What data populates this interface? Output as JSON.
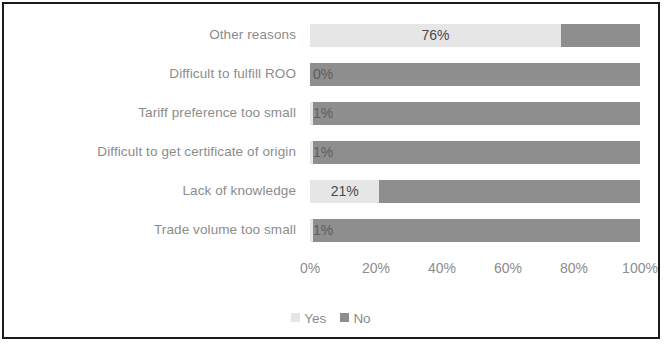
{
  "chart_data": {
    "type": "bar",
    "orientation": "horizontal",
    "stacked": true,
    "stacked_percent": true,
    "title": "",
    "subtitle": "",
    "xlabel": "",
    "ylabel": "",
    "xlim": [
      0,
      100
    ],
    "grid": false,
    "legend_position": "bottom",
    "categories": [
      "Other reasons",
      "Difficult to fulfill ROO",
      "Tariff preference too small",
      "Difficult to get certificate of origin",
      "Lack of knowledge",
      "Trade volume too small"
    ],
    "series": [
      {
        "name": "Yes",
        "color": "#e6e6e6",
        "values": [
          76,
          0,
          1,
          1,
          21,
          1
        ],
        "labels": [
          "76%",
          "0%",
          "1%",
          "1%",
          "21%",
          "1%"
        ]
      },
      {
        "name": "No",
        "color": "#8e8e8e",
        "values": [
          24,
          100,
          99,
          99,
          79,
          99
        ],
        "labels": [
          "",
          "",
          "",
          "",
          "",
          ""
        ]
      }
    ],
    "xticks": [
      0,
      20,
      40,
      60,
      80,
      100
    ],
    "xtick_labels": [
      "0%",
      "20%",
      "40%",
      "60%",
      "80%",
      "100%"
    ]
  },
  "legend": {
    "items": [
      {
        "label": "Yes",
        "color": "#e6e6e6"
      },
      {
        "label": "No",
        "color": "#8e8e8e"
      }
    ]
  },
  "colors": {
    "yes": "#e6e6e6",
    "no": "#8e8e8e",
    "text": "#8c8c8c",
    "value_text": "#4a4a4a",
    "frame": "#1a1a1a",
    "background": "#ffffff"
  }
}
